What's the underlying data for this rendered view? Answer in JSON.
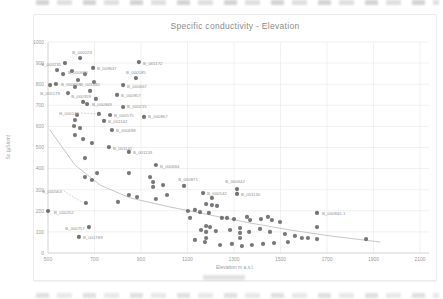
{
  "chart_data": {
    "type": "scatter",
    "title": "Specific conductivity - Elevation",
    "xlabel": "Elevation m a.s.l.",
    "ylabel": "Sc (µS/cm)",
    "xlim": [
      500,
      2100
    ],
    "ylim": [
      0,
      1000
    ],
    "x_ticks": [
      500,
      700,
      900,
      1100,
      1300,
      1500,
      1700,
      1900,
      2100
    ],
    "y_ticks": [
      0,
      100,
      200,
      300,
      400,
      500,
      600,
      700,
      800,
      900,
      1000
    ],
    "grid": true,
    "legend": "none",
    "colors": {
      "point": "#5a5a5a",
      "trendline": "#c7c7c7",
      "grid": "#ebebeb",
      "axis": "#d2d2d2",
      "title": "#8c8c8c",
      "tick": "#9c9c9c",
      "point_label": "#8f8f8f",
      "leader": "#b5b5b5"
    },
    "labeled_points": [
      {
        "label": "B_000223",
        "x": 638,
        "y": 924,
        "anchor": "middle",
        "dx": 2,
        "dy": -6
      },
      {
        "label": "B_000235",
        "x": 573,
        "y": 900,
        "anchor": "end",
        "dx": -4,
        "dy": 1
      },
      {
        "label": "B_009647",
        "x": 694,
        "y": 877,
        "anchor": "start",
        "dx": 4,
        "dy": 1
      },
      {
        "label": "B_065172",
        "x": 891,
        "y": 905,
        "anchor": "start",
        "dx": 4,
        "dy": 1
      },
      {
        "label": "B_000630",
        "x": 565,
        "y": 848,
        "anchor": "start",
        "dx": 5,
        "dy": -2
      },
      {
        "label": "B_001240",
        "x": 629,
        "y": 820,
        "anchor": "start",
        "dx": 2,
        "dy": 5
      },
      {
        "label": "B_000585",
        "x": 878,
        "y": 829,
        "anchor": "middle",
        "dx": 0,
        "dy": -6
      },
      {
        "label": "B_000663",
        "x": 534,
        "y": 801,
        "anchor": "start",
        "dx": 5,
        "dy": 1
      },
      {
        "label": "B_005179",
        "x": 509,
        "y": 796,
        "anchor": "middle",
        "dx": 0,
        "dy": 8
      },
      {
        "label": "B_000667",
        "x": 823,
        "y": 796,
        "anchor": "start",
        "dx": 4,
        "dy": 1
      },
      {
        "label": "B_000957",
        "x": 797,
        "y": 749,
        "anchor": "start",
        "dx": 4,
        "dy": 1
      },
      {
        "label": "B_000359",
        "x": 651,
        "y": 716,
        "anchor": "middle",
        "dx": -2,
        "dy": -5
      },
      {
        "label": "B_000949",
        "x": 668,
        "y": 706,
        "anchor": "start",
        "dx": 5,
        "dy": 0
      },
      {
        "label": "B_000215",
        "x": 823,
        "y": 692,
        "anchor": "start",
        "dx": 4,
        "dy": 0
      },
      {
        "label": "B_000145",
        "x": 719,
        "y": 659,
        "anchor": "end",
        "dx": -20,
        "dy": 0,
        "leader": true
      },
      {
        "label": "B_000575",
        "x": 767,
        "y": 654,
        "anchor": "start",
        "dx": 4,
        "dy": 0
      },
      {
        "label": "B_001142",
        "x": 741,
        "y": 626,
        "anchor": "start",
        "dx": 4,
        "dy": 1
      },
      {
        "label": "B_000867",
        "x": 913,
        "y": 645,
        "anchor": "start",
        "dx": 4,
        "dy": 0
      },
      {
        "label": "B_000698",
        "x": 775,
        "y": 583,
        "anchor": "start",
        "dx": 4,
        "dy": 1
      },
      {
        "label": "B_001141",
        "x": 762,
        "y": 502,
        "anchor": "start",
        "dx": 4,
        "dy": 1
      },
      {
        "label": "B_001133",
        "x": 848,
        "y": 479,
        "anchor": "start",
        "dx": 4,
        "dy": 1
      },
      {
        "label": "B_000664",
        "x": 964,
        "y": 417,
        "anchor": "start",
        "dx": 4,
        "dy": 1
      },
      {
        "label": "B_000563",
        "x": 663,
        "y": 237,
        "anchor": "end",
        "dx": -24,
        "dy": -11,
        "leader": true
      },
      {
        "label": "B_000252",
        "x": 500,
        "y": 199,
        "anchor": "start",
        "dx": 6,
        "dy": 1
      },
      {
        "label": "B_000757",
        "x": 676,
        "y": 123,
        "anchor": "end",
        "dx": -4,
        "dy": 1
      },
      {
        "label": "B_001789",
        "x": 633,
        "y": 76,
        "anchor": "start",
        "dx": 4,
        "dy": 1
      },
      {
        "label": "B_000871",
        "x": 1085,
        "y": 318,
        "anchor": "middle",
        "dx": 4,
        "dy": -6
      },
      {
        "label": "B_000642",
        "x": 1313,
        "y": 303,
        "anchor": "middle",
        "dx": -2,
        "dy": -8
      },
      {
        "label": "B_000542",
        "x": 1167,
        "y": 284,
        "anchor": "start",
        "dx": 4,
        "dy": 0
      },
      {
        "label": "B_001130",
        "x": 1313,
        "y": 280,
        "anchor": "start",
        "dx": 4,
        "dy": 1
      },
      {
        "label": "B_000845-1",
        "x": 1657,
        "y": 190,
        "anchor": "start",
        "dx": 5,
        "dy": 1
      }
    ],
    "extra_points": [
      [
        539,
        867
      ],
      [
        603,
        862
      ],
      [
        659,
        848
      ],
      [
        698,
        810
      ],
      [
        616,
        787
      ],
      [
        681,
        768
      ],
      [
        586,
        758
      ],
      [
        706,
        730
      ],
      [
        625,
        654
      ],
      [
        616,
        630
      ],
      [
        612,
        602
      ],
      [
        638,
        592
      ],
      [
        616,
        559
      ],
      [
        651,
        540
      ],
      [
        689,
        521
      ],
      [
        659,
        450
      ],
      [
        711,
        379
      ],
      [
        659,
        360
      ],
      [
        689,
        346
      ],
      [
        848,
        379
      ],
      [
        939,
        360
      ],
      [
        952,
        336
      ],
      [
        995,
        322
      ],
      [
        848,
        275
      ],
      [
        883,
        265
      ],
      [
        801,
        242
      ],
      [
        952,
        313
      ],
      [
        964,
        256
      ],
      [
        1012,
        275
      ],
      [
        1102,
        199
      ],
      [
        1111,
        166
      ],
      [
        1205,
        261
      ],
      [
        1180,
        232
      ],
      [
        1205,
        227
      ],
      [
        1227,
        223
      ],
      [
        1132,
        204
      ],
      [
        1154,
        194
      ],
      [
        1192,
        190
      ],
      [
        1248,
        166
      ],
      [
        1270,
        166
      ],
      [
        1300,
        161
      ],
      [
        1356,
        171
      ],
      [
        1369,
        156
      ],
      [
        1416,
        161
      ],
      [
        1446,
        171
      ],
      [
        1463,
        156
      ],
      [
        1498,
        147
      ],
      [
        1180,
        128
      ],
      [
        1197,
        123
      ],
      [
        1158,
        109
      ],
      [
        1222,
        104
      ],
      [
        1283,
        109
      ],
      [
        1326,
        118
      ],
      [
        1326,
        95
      ],
      [
        1326,
        71
      ],
      [
        1365,
        100
      ],
      [
        1412,
        114
      ],
      [
        1455,
        100
      ],
      [
        1519,
        90
      ],
      [
        1562,
        81
      ],
      [
        1592,
        71
      ],
      [
        1618,
        71
      ],
      [
        1132,
        62
      ],
      [
        1175,
        52
      ],
      [
        1180,
        100
      ],
      [
        1180,
        71
      ],
      [
        1240,
        38
      ],
      [
        1291,
        43
      ],
      [
        1334,
        33
      ],
      [
        1377,
        38
      ],
      [
        1425,
        43
      ],
      [
        1472,
        47
      ],
      [
        1532,
        52
      ],
      [
        1657,
        123
      ],
      [
        1657,
        66
      ],
      [
        1868,
        66
      ]
    ],
    "trendline": {
      "x": [
        508,
        616,
        724,
        853,
        1025,
        1197,
        1369,
        1541,
        1713,
        1928
      ],
      "y": [
        583,
        417,
        322,
        261,
        218,
        180,
        142,
        109,
        81,
        52
      ]
    }
  }
}
